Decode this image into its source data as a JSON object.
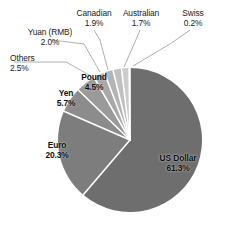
{
  "chart_data": {
    "type": "pie",
    "title": "",
    "categories": [
      "US Dollar",
      "Euro",
      "Yen",
      "Pound",
      "Others",
      "Yuan (RMB)",
      "Canadian",
      "Australian",
      "Swiss"
    ],
    "values": [
      61.3,
      20.3,
      5.7,
      4.5,
      2.5,
      2.0,
      1.9,
      1.7,
      0.2
    ],
    "value_unit": "%",
    "start_angle_deg": 0,
    "direction": "clockwise",
    "legend": "none",
    "labels_position": "inside-and-leader-lines",
    "slice_colors": [
      "#6e6e6e",
      "#7d7d7d",
      "#8c8c8c",
      "#9a9a9a",
      "#a8a8a8",
      "#b4b4b4",
      "#c0c0c0",
      "#cccccc",
      "#d8d8d8"
    ],
    "separator_color": "#ffffff",
    "background": "#ffffff",
    "slices": [
      {
        "name": "US Dollar",
        "pct_label": "61.3%",
        "value": 61.3,
        "color": "#6e6e6e",
        "label_mode": "inside"
      },
      {
        "name": "Euro",
        "pct_label": "20.3%",
        "value": 20.3,
        "color": "#7d7d7d",
        "label_mode": "inside"
      },
      {
        "name": "Yen",
        "pct_label": "5.7%",
        "value": 5.7,
        "color": "#8c8c8c",
        "label_mode": "inside"
      },
      {
        "name": "Pound",
        "pct_label": "4.5%",
        "value": 4.5,
        "color": "#9a9a9a",
        "label_mode": "inside"
      },
      {
        "name": "Others",
        "pct_label": "2.5%",
        "value": 2.5,
        "color": "#a8a8a8",
        "label_mode": "leader"
      },
      {
        "name": "Yuan (RMB)",
        "pct_label": "2.0%",
        "value": 2.0,
        "color": "#b4b4b4",
        "label_mode": "leader"
      },
      {
        "name": "Canadian",
        "pct_label": "1.9%",
        "value": 1.9,
        "color": "#c0c0c0",
        "label_mode": "leader"
      },
      {
        "name": "Australian",
        "pct_label": "1.7%",
        "value": 1.7,
        "color": "#cccccc",
        "label_mode": "leader"
      },
      {
        "name": "Swiss",
        "pct_label": "0.2%",
        "value": 0.2,
        "color": "#d8d8d8",
        "label_mode": "leader"
      }
    ]
  }
}
